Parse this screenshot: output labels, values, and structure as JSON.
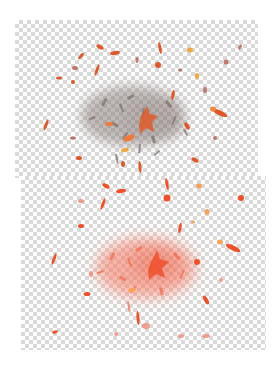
{
  "panels": [
    {
      "id": "top",
      "description": "particle splatter on transparent background, desaturated gray core with orange fragments",
      "core_color": "#8a7f7c",
      "fragment_colors": [
        "#e0592a",
        "#ef7a3a",
        "#f0a840",
        "#b35a4a",
        "#9a8a88"
      ]
    },
    {
      "id": "bottom",
      "description": "particle splatter on transparent background, saturated red-orange core and fragments",
      "core_color": "#f26b4c",
      "fragment_colors": [
        "#f0502a",
        "#f5774a",
        "#f7a35a",
        "#f08a7a",
        "#f5b070"
      ]
    }
  ],
  "checker": {
    "light": "#ffffff",
    "dark": "#d9d9d9",
    "cell_px": 4
  }
}
